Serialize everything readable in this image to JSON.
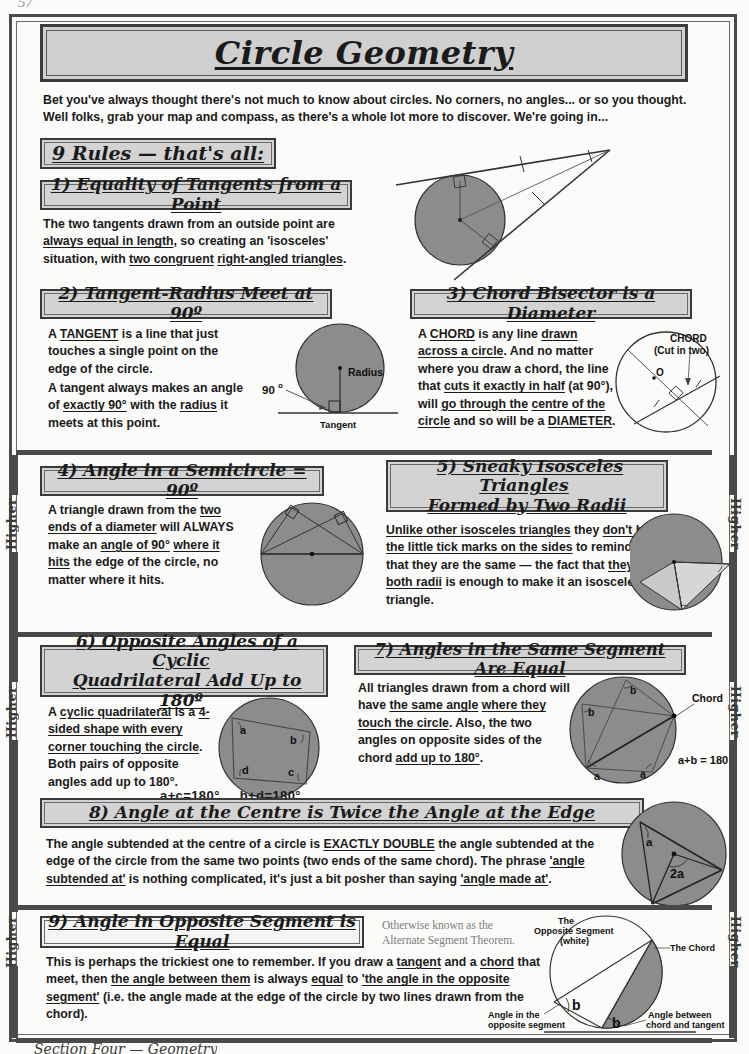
{
  "page": {
    "corner_mark": "57",
    "title": "Circle Geometry",
    "footer": "Section Four — Geometry",
    "higher_tab_label": "Higher",
    "intro": "Bet you've always thought there's not much to know about circles.  No corners, no angles... or so you thought.  Well folks, grab your map and compass, as there's a whole lot more to discover.  We're going in..."
  },
  "colors": {
    "page_background": "#fbfbf9",
    "frame": "#4a4a4a",
    "heading_fill": "#d3d3d3",
    "title_fill": "#cfcfcf",
    "circle_fill": "#8c8c8c",
    "circle_fill_light": "#bdbdbd",
    "ink": "#1a1a1a",
    "note_grey": "#7c7c7c"
  },
  "rules_heading": "9 Rules — that's all:",
  "rules": [
    {
      "number": "1)",
      "title": "1) Equality of Tangents from a Point",
      "body_html": "The two tangents drawn from an outside point are <u>always equal in length</u>, so creating an 'isosceles' situation, with <u>two congruent</u> <u>right-angled triangles</u>.",
      "diagram_name": "tangents-from-point-diagram"
    },
    {
      "number": "2)",
      "title": "2) Tangent-Radius Meet at 90º",
      "body_html_1": "A <u>TANGENT</u> is a line that just touches a single point on the edge of the circle.",
      "body_html_2": "A tangent always makes an angle of <u>exactly 90°</u> with the <u>radius</u> it meets at this point.",
      "diagram_name": "tangent-radius-diagram",
      "diagram_labels": [
        "90",
        "Radius",
        "Tangent"
      ]
    },
    {
      "number": "3)",
      "title": "3) Chord Bisector is a Diameter",
      "body_html": "A <u>CHORD</u> is any line <u>drawn</u> <u>across a circle</u>.  And no matter where you draw a chord, the line that <u>cuts it exactly in half</u> (at 90°), will <u>go through the</u> <u>centre of the circle</u> and so will be a <u>DIAMETER</u>.",
      "diagram_name": "chord-bisector-diagram",
      "diagram_labels": [
        "CHORD",
        "(Cut in two)",
        "O"
      ]
    },
    {
      "number": "4)",
      "title": "4) Angle in a Semicircle = 90º",
      "body_html": "A triangle drawn from the <u>two ends of a diameter</u> will ALWAYS make an <u>angle of 90°</u> <u>where it hits</u> the edge of the circle, no matter where it hits.",
      "diagram_name": "angle-in-semicircle-diagram"
    },
    {
      "number": "5)",
      "title": "5) Sneaky Isosceles Triangles Formed by Two Radii",
      "title_line_1": "5) Sneaky Isosceles Triangles",
      "title_line_2": "Formed by Two Radii",
      "body_html": "<u>Unlike other isosceles triangles</u> they <u>don't have the little tick marks on the sides</u> to remind you that they are the same — the fact that <u>they are both radii</u> is enough to make it an isosceles triangle.",
      "diagram_name": "isosceles-from-radii-diagram"
    },
    {
      "number": "6)",
      "title": "6) Opposite Angles of a Cyclic Quadrilateral Add Up to 180º",
      "title_line_1": "6) Opposite Angles of a Cyclic",
      "title_line_2": "Quadrilateral Add Up to 180º",
      "body_html": "A <u>cyclic quadrilateral</u> is a <u>4-sided shape with every</u> <u>corner touching the circle</u>. Both pairs of opposite angles add up to 180°.",
      "diagram_name": "cyclic-quadrilateral-diagram",
      "diagram_labels": [
        "a",
        "b",
        "c",
        "d"
      ],
      "formula_1": "a+c=180°",
      "formula_2": "b+d=180°"
    },
    {
      "number": "7)",
      "title": "7) Angles in the Same Segment Are Equal",
      "body_html": "All triangles drawn from a chord will have <u>the same angle</u> <u>where they touch the circle</u>. Also, the two angles on opposite sides of the chord <u>add up to 180°</u>.",
      "diagram_name": "same-segment-angles-diagram",
      "diagram_labels": [
        "a",
        "b",
        "Chord"
      ],
      "formula": "a+b = 180º"
    },
    {
      "number": "8)",
      "title": "8) Angle at the Centre is Twice the Angle at the Edge",
      "body_html": "The angle subtended at the centre of a circle is <u>EXACTLY DOUBLE</u> the angle subtended at the edge of the circle from the same two points (two ends of the same chord).  The phrase <u>'angle subtended at'</u> is nothing complicated, it's just a bit posher than saying <u>'angle made at'</u>.",
      "diagram_name": "angle-at-centre-diagram",
      "diagram_labels": [
        "a",
        "2a"
      ]
    },
    {
      "number": "9)",
      "title": "9) Angle in Opposite Segment is Equal",
      "note_line_1": "Otherwise known as the",
      "note_line_2": "Alternate Segment Theorem.",
      "body_html": "This is perhaps the trickiest one to remember.  If you draw a <u>tangent</u> and a <u>chord</u> that meet, then <u>the angle between them</u> is always <u>equal</u> to <u>'the angle in the opposite segment'</u> (i.e. the angle made at the edge of the circle by two lines drawn from the chord).",
      "diagram_name": "alternate-segment-diagram",
      "diagram_labels": [
        "The",
        "Opposite Segment",
        "(white)",
        "The Chord",
        "b",
        "b",
        "Angle in the",
        "opposite segment",
        "Angle between",
        "chord and tangent"
      ]
    }
  ]
}
